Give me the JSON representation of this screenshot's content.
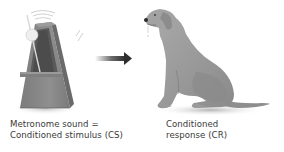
{
  "diagram": {
    "stimulus": {
      "icon": "metronome-icon",
      "caption_line1": "Metronome sound =",
      "caption_line2": "Conditioned stimulus (CS)"
    },
    "connector": {
      "icon": "arrow-right-icon"
    },
    "response": {
      "icon": "dog-icon",
      "caption_line1": "Conditioned",
      "caption_line2": "response (CR)"
    },
    "colors": {
      "background": "#ffffff",
      "metronome_body": "#8c8c8c",
      "metronome_dark": "#5e5e5e",
      "dog_body": "#9a9a9a",
      "arrow": "#3a3a3a",
      "text": "#3a3a3a"
    }
  }
}
